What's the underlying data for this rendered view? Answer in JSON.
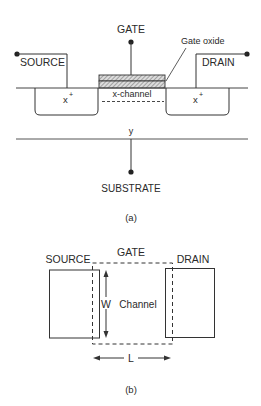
{
  "figure_a": {
    "gate_label": "GATE",
    "gate_oxide_label": "Gate oxide",
    "source_label": "SOURCE",
    "drain_label": "DRAIN",
    "source_region_label": "x",
    "drain_region_label": "x",
    "doping_superscript": "+",
    "channel_label": "x-channel",
    "y_label": "y",
    "substrate_label": "SUBSTRATE",
    "caption": "(a)"
  },
  "figure_b": {
    "source_label": "SOURCE",
    "gate_label": "GATE",
    "drain_label": "DRAIN",
    "width_label": "W",
    "channel_label": "Channel",
    "length_label": "L",
    "caption": "(b)"
  },
  "colors": {
    "line": "#333333",
    "text": "#2a2a2a",
    "hatch": "#555555",
    "background": "#ffffff"
  }
}
